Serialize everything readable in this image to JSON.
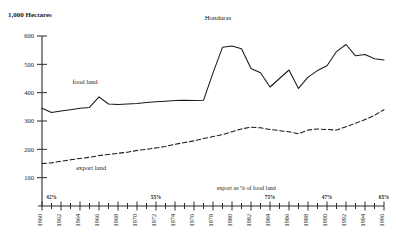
{
  "chart_data": {
    "type": "line",
    "title": "Honduras",
    "unit_label": "1,000 Hectares",
    "xlabel": "",
    "ylabel": "",
    "ylim": [
      0,
      600
    ],
    "yticks": [
      100,
      200,
      300,
      400,
      500,
      600
    ],
    "xlim": [
      1960,
      1996
    ],
    "grid": false,
    "legend_position": "inline-labels",
    "x": [
      1960,
      1961,
      1962,
      1963,
      1964,
      1965,
      1966,
      1967,
      1968,
      1969,
      1970,
      1971,
      1972,
      1973,
      1974,
      1975,
      1976,
      1977,
      1978,
      1979,
      1980,
      1981,
      1982,
      1983,
      1984,
      1985,
      1986,
      1987,
      1988,
      1989,
      1990,
      1991,
      1992,
      1993,
      1994,
      1995,
      1996
    ],
    "xticks": [
      1960,
      1962,
      1964,
      1966,
      1968,
      1970,
      1972,
      1974,
      1976,
      1978,
      1980,
      1982,
      1984,
      1986,
      1988,
      1990,
      1992,
      1994,
      1996
    ],
    "xticklabels": [
      "1960",
      "1962",
      "1964",
      "1966",
      "1968",
      "1970",
      "1972",
      "1974",
      "1976",
      "1978",
      "1980",
      "1982",
      "1984",
      "1986",
      "1988",
      "1990",
      "1992",
      "1994",
      "1996"
    ],
    "series": [
      {
        "name": "food land",
        "style": "solid",
        "label_x": 1963.2,
        "label_y": 432,
        "values": [
          345,
          330,
          335,
          340,
          345,
          348,
          385,
          360,
          358,
          360,
          362,
          365,
          368,
          370,
          372,
          373,
          372,
          373,
          470,
          560,
          565,
          555,
          485,
          470,
          420,
          450,
          480,
          415,
          455,
          478,
          495,
          545,
          570,
          530,
          535,
          520,
          515
        ]
      },
      {
        "name": "export land",
        "style": "dashed",
        "label_x": 1963.6,
        "label_y": 128,
        "values": [
          150,
          152,
          158,
          163,
          168,
          172,
          178,
          182,
          186,
          190,
          196,
          200,
          205,
          210,
          218,
          224,
          230,
          238,
          245,
          252,
          262,
          272,
          278,
          276,
          270,
          266,
          262,
          255,
          268,
          272,
          270,
          268,
          280,
          292,
          305,
          320,
          340
        ]
      }
    ],
    "annotations": [
      {
        "text": "export as % of food land",
        "x": 1981.5,
        "y": 55
      }
    ],
    "percent_marks": [
      {
        "label": "42%",
        "year": 1961
      },
      {
        "label": "55%",
        "year": 1972
      },
      {
        "label": "75%",
        "year": 1984
      },
      {
        "label": "47%",
        "year": 1990
      },
      {
        "label": "65%",
        "year": 1996
      }
    ]
  }
}
